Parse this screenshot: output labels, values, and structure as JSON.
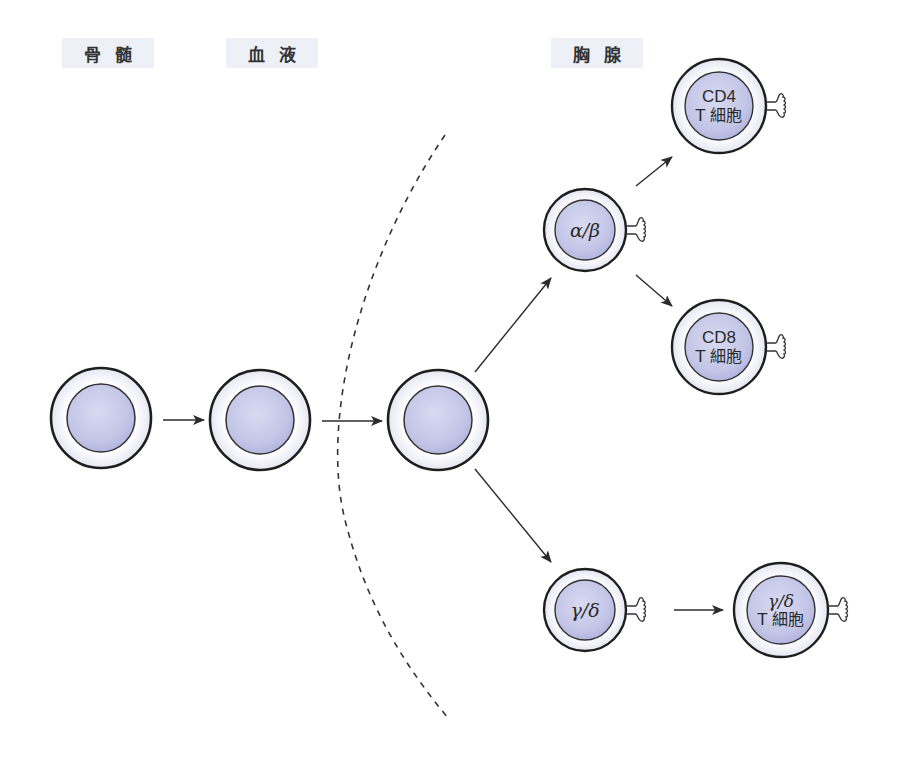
{
  "stages": {
    "bone_marrow": "骨髄",
    "blood": "血液",
    "thymus": "胸腺"
  },
  "cells": {
    "bone_marrow_precursor": {
      "label": ""
    },
    "blood_precursor": {
      "label": ""
    },
    "thymocyte": {
      "label": ""
    },
    "alpha_beta": {
      "label": "α/β"
    },
    "cd4": {
      "line1": "CD4",
      "line2": "T 細胞"
    },
    "cd8": {
      "line1": "CD8",
      "line2": "T 細胞"
    },
    "gamma_delta": {
      "label": "γ/δ"
    },
    "gamma_delta_t": {
      "line1": "γ/δ",
      "line2": "T 細胞"
    }
  },
  "colors": {
    "nucleus_fill": "#c4c6e8",
    "membrane_fill": "#f4f4fb",
    "outline": "#1e1e1e",
    "label_bg": "#eef0f8",
    "arrow": "#2b2b2b"
  },
  "edges": [
    {
      "from": "bone_marrow_precursor",
      "to": "blood_precursor"
    },
    {
      "from": "blood_precursor",
      "to": "thymocyte"
    },
    {
      "from": "thymocyte",
      "to": "alpha_beta"
    },
    {
      "from": "thymocyte",
      "to": "gamma_delta"
    },
    {
      "from": "alpha_beta",
      "to": "cd4"
    },
    {
      "from": "alpha_beta",
      "to": "cd8"
    },
    {
      "from": "gamma_delta",
      "to": "gamma_delta_t"
    }
  ],
  "boundary": "dashed thymus boundary arc"
}
